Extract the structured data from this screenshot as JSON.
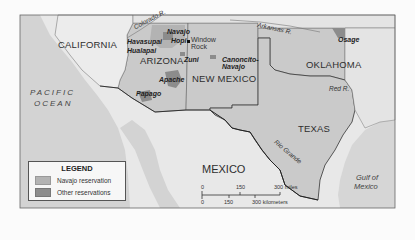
{
  "map": {
    "colors": {
      "ocean": "#d4d4d4",
      "us_land": "#c9c9c9",
      "other_land": "#e7e7e7",
      "navajo_reservation": "#b3b3b3",
      "other_reservations": "#8c8c8c",
      "borders": "#555555",
      "frame": "#666666"
    },
    "states": [
      "CALIFORNIA",
      "ARIZONA",
      "NEW MEXICO",
      "OKLAHOMA",
      "TEXAS"
    ],
    "country": "MEXICO",
    "water_bodies": {
      "pacific": [
        "PACIFIC",
        "OCEAN"
      ],
      "gulf": [
        "Gulf of",
        "Mexico"
      ]
    },
    "rivers": [
      "Colorado R.",
      "Arkansas R.",
      "Red R.",
      "Rio Grande"
    ],
    "reservations": [
      "Navajo",
      "Hopi",
      "Havasupai",
      "Hualapai",
      "Zuni",
      "Apache",
      "Papago",
      "Canoncito-Navajo",
      "Osage"
    ],
    "cities": [
      "Window Rock"
    ]
  },
  "legend": {
    "title": "LEGEND",
    "items": [
      {
        "label": "Navajo reservation",
        "color": "#b3b3b3"
      },
      {
        "label": "Other reservations",
        "color": "#8c8c8c"
      }
    ]
  },
  "scale": {
    "miles": [
      "0",
      "150",
      "300 miles"
    ],
    "kilometers": [
      "0",
      "150",
      "300 kilometers"
    ]
  }
}
